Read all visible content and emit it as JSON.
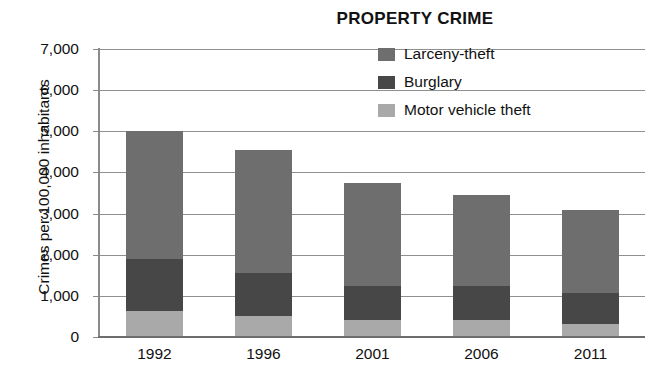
{
  "chart_data": {
    "type": "bar",
    "subtype": "stacked-vertical-bar",
    "title": "PROPERTY CRIME",
    "xlabel": "",
    "ylabel": "Crimes per 100,000 inhabitants",
    "categories": [
      "1992",
      "1996",
      "2001",
      "2006",
      "2011"
    ],
    "ylim": [
      0,
      7000
    ],
    "ytick_values": [
      0,
      1000,
      2000,
      3000,
      4000,
      5000,
      6000,
      7000
    ],
    "ytick_labels": [
      "0",
      "1,000",
      "2,000",
      "3,000",
      "4,000",
      "5,000",
      "6,000",
      "7,000"
    ],
    "grid": true,
    "legend_position": "top-right",
    "stack_order_bottom_to_top": [
      "Motor vehicle theft",
      "Burglary",
      "Larceny-theft"
    ],
    "series": [
      {
        "name": "Larceny-theft",
        "color": "#6e6e6e",
        "values": [
          3100,
          3000,
          2520,
          2200,
          2010
        ]
      },
      {
        "name": "Burglary",
        "color": "#474747",
        "values": [
          1270,
          1030,
          810,
          830,
          760
        ]
      },
      {
        "name": "Motor vehicle theft",
        "color": "#a9a9a9",
        "values": [
          630,
          520,
          420,
          420,
          310
        ]
      }
    ],
    "stack_totals": [
      5000,
      4550,
      3750,
      3450,
      3080
    ]
  },
  "legend": {
    "items": [
      {
        "label": "Larceny-theft",
        "color": "#6e6e6e"
      },
      {
        "label": "Burglary",
        "color": "#474747"
      },
      {
        "label": "Motor vehicle theft",
        "color": "#a9a9a9"
      }
    ]
  },
  "colors": {
    "background": "#ffffff",
    "gridline": "#8f8f8f",
    "axis": "#6d6d6d",
    "text": "#111111"
  }
}
